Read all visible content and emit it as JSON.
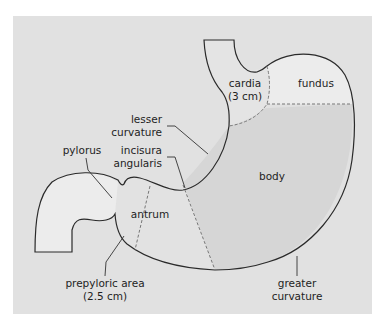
{
  "figure": {
    "type": "anatomical-diagram",
    "colors": {
      "panel_background": "#e1e1e1",
      "outline": "#2a2a2a",
      "fundus_fill": "#ececec",
      "cardia_fill": "#e3e3e3",
      "body_fill": "#d6d6d6",
      "antrum_fill": "#e2e2e2",
      "duodenum_fill": "#ececec",
      "divider": "#777777"
    },
    "labels": {
      "cardia_line1": "cardia",
      "cardia_line2": "(3 cm)",
      "fundus": "fundus",
      "lesser_curvature_line1": "lesser",
      "lesser_curvature_line2": "curvature",
      "pylorus": "pylorus",
      "incisura_line1": "incisura",
      "incisura_line2": "angularis",
      "body": "body",
      "antrum": "antrum",
      "prepyloric_line1": "prepyloric area",
      "prepyloric_line2": "(2.5 cm)",
      "greater_curvature_line1": "greater",
      "greater_curvature_line2": "curvature"
    }
  }
}
